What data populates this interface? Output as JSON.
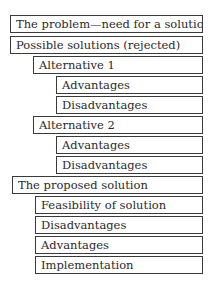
{
  "outline": {
    "items": [
      {
        "label": "The problem—need for a solution",
        "level": 0
      },
      {
        "label": "Possible solutions (rejected)",
        "level": 0
      },
      {
        "label": "Alternative 1",
        "level": 1
      },
      {
        "label": "Advantages",
        "level": 2
      },
      {
        "label": "Disadvantages",
        "level": 2
      },
      {
        "label": "Alternative 2",
        "level": 1
      },
      {
        "label": "Advantages",
        "level": 2
      },
      {
        "label": "Disadvantages",
        "level": 2
      },
      {
        "label": "The proposed solution",
        "level": 0
      },
      {
        "label": "Feasibility of solution",
        "level": 1
      },
      {
        "label": "Disadvantages",
        "level": 1
      },
      {
        "label": "Advantages",
        "level": 1
      },
      {
        "label": "Implementation",
        "level": 1
      }
    ]
  }
}
